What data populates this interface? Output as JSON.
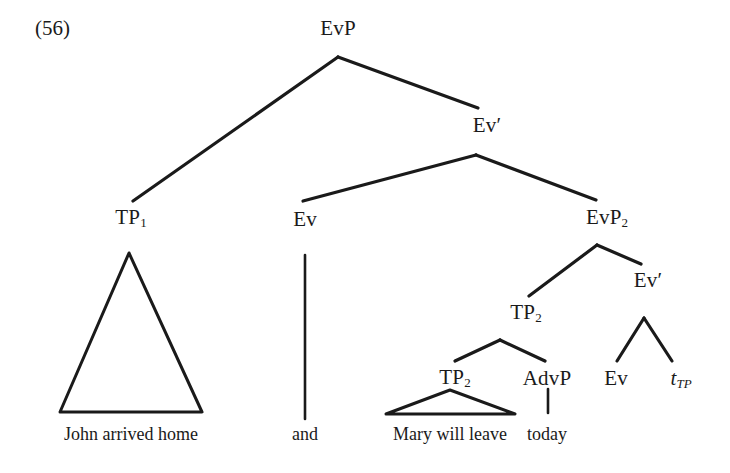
{
  "figure": {
    "example_number": "(56)",
    "kind": "syntactic-tree-diagram",
    "ink_color": "#1a1a1a",
    "background_color": "#ffffff"
  },
  "nodes": {
    "root": {
      "label": "EvP",
      "x": 338,
      "y": 28
    },
    "tp1": {
      "label": "TP",
      "sub": "1",
      "x": 131,
      "y": 218
    },
    "ev_bar_upper": {
      "label": "Ev",
      "prime": "′",
      "x": 487,
      "y": 125
    },
    "ev_head_upper": {
      "label": "Ev",
      "x": 305,
      "y": 219
    },
    "evp2": {
      "label": "EvP",
      "sub": "2",
      "x": 607,
      "y": 218
    },
    "tp2_upper": {
      "label": "TP",
      "sub": "2",
      "x": 526,
      "y": 313
    },
    "ev_bar_lower": {
      "label": "Ev",
      "prime": "′",
      "x": 648,
      "y": 280
    },
    "tp2_lower": {
      "label": "TP",
      "sub": "2",
      "x": 455,
      "y": 378
    },
    "advp": {
      "label": "AdvP",
      "x": 547,
      "y": 378
    },
    "ev_head_lower": {
      "label": "Ev",
      "x": 616,
      "y": 378
    },
    "trace_tp": {
      "label": "t",
      "sub": "TP",
      "x": 681,
      "y": 379
    }
  },
  "terminals": {
    "john": {
      "text": "John arrived home",
      "x": 131,
      "y": 434
    },
    "and": {
      "text": "and",
      "x": 305,
      "y": 434
    },
    "mary": {
      "text": "Mary will leave",
      "x": 450,
      "y": 434
    },
    "today": {
      "text": "today",
      "x": 547,
      "y": 434
    }
  }
}
